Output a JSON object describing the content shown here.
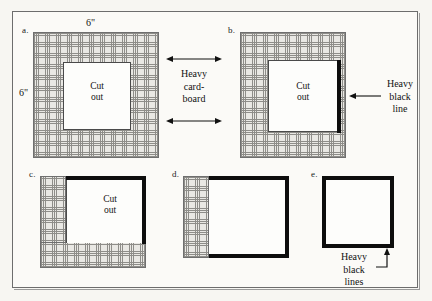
{
  "figure": {
    "background_color": "#f7f6f2",
    "frame_color": "#6d6d6d",
    "hatch_color": "#8e8d89",
    "black_line_color": "#0d0d0d"
  },
  "dimensions": {
    "top_label": "6\"",
    "left_label": "6\""
  },
  "panels": [
    {
      "id": "a",
      "label": "a.",
      "cut_out_line1": "Cut",
      "cut_out_line2": "out",
      "description": "full square of heavy cardboard with square cut out in center"
    },
    {
      "id": "b",
      "label": "b.",
      "cut_out_line1": "Cut",
      "cut_out_line2": "out",
      "description": "cardboard with cut out and heavy black line on right edge of cut out"
    },
    {
      "id": "c",
      "label": "c.",
      "cut_out_line1": "Cut",
      "cut_out_line2": "out",
      "description": "cardboard remaining on left and bottom, heavy black lines top and right"
    },
    {
      "id": "d",
      "label": "d.",
      "cut_out_line1": "",
      "cut_out_line2": "",
      "description": "cardboard strip on left only, heavy black lines top right and bottom"
    },
    {
      "id": "e",
      "label": "e.",
      "cut_out_line1": "",
      "cut_out_line2": "",
      "description": "complete heavy black line square, no cardboard"
    }
  ],
  "annotations": {
    "cardboard": {
      "line1": "Heavy",
      "line2": "card-",
      "line3": "board"
    },
    "black_line": {
      "line1": "Heavy",
      "line2": "black",
      "line3": "line"
    },
    "black_lines": {
      "line1": "Heavy",
      "line2": "black",
      "line3": "lines"
    }
  }
}
